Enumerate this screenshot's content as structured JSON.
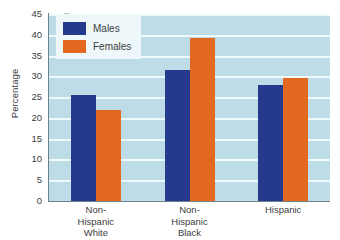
{
  "chart_data": {
    "type": "bar",
    "title": "",
    "xlabel": "",
    "ylabel": "Percentage",
    "ylim": [
      0,
      45
    ],
    "ytick_step": 5,
    "yticks": [
      0,
      5,
      10,
      15,
      20,
      25,
      30,
      35,
      40,
      45
    ],
    "grid": true,
    "legend_position": "top-left",
    "categories": [
      "Non-\nHispanic\nWhite",
      "Non-\nHispanic\nBlack",
      "Hispanic"
    ],
    "category_lines": [
      [
        "Non-",
        "Hispanic",
        "White"
      ],
      [
        "Non-",
        "Hispanic",
        "Black"
      ],
      [
        "Hispanic"
      ]
    ],
    "series": [
      {
        "name": "Males",
        "color": "#253a8c",
        "values": [
          25.4,
          31.5,
          27.8
        ]
      },
      {
        "name": "Females",
        "color": "#e2691f",
        "values": [
          21.9,
          39.3,
          29.5
        ]
      }
    ]
  },
  "legend": {
    "items": [
      {
        "label": "Males",
        "swatch": "males-swatch"
      },
      {
        "label": "Females",
        "swatch": "females-swatch"
      }
    ]
  },
  "colors": {
    "plot_background": "#bddce7",
    "gridline": "#f2fbfd",
    "axis": "#6f8189",
    "males": "#253a8c",
    "females": "#e2691f",
    "text": "#3c3c3c",
    "page_background": "#ffffff",
    "legend_background": "#eef8fb"
  }
}
